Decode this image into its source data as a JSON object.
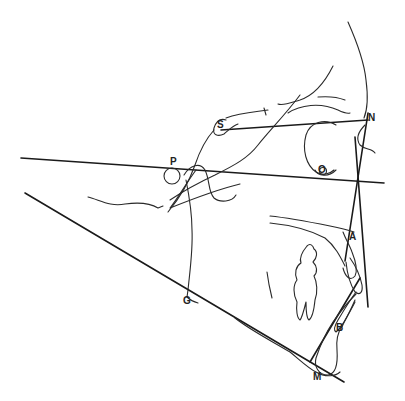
{
  "diagram": {
    "type": "cephalometric tracing",
    "landmarks": [
      {
        "id": "S",
        "label": "S",
        "x": 221,
        "y": 129
      },
      {
        "id": "N",
        "label": "N",
        "x": 372,
        "y": 119
      },
      {
        "id": "P",
        "label": "P",
        "x": 174,
        "y": 162
      },
      {
        "id": "O",
        "label": "O",
        "x": 323,
        "y": 174
      },
      {
        "id": "A",
        "label": "A",
        "x": 353,
        "y": 236
      },
      {
        "id": "B",
        "label": "B",
        "x": 339,
        "y": 327
      },
      {
        "id": "G",
        "label": "G",
        "x": 187,
        "y": 302
      },
      {
        "id": "M",
        "label": "M",
        "x": 318,
        "y": 377
      }
    ],
    "reference_lines": [
      {
        "name": "S-N line",
        "from": "S",
        "to": "N"
      },
      {
        "name": "Frankfort horizontal (P-O)",
        "from": "P",
        "to": "O"
      },
      {
        "name": "N-A line",
        "from": "N",
        "to": "A"
      },
      {
        "name": "A-B line",
        "from": "A",
        "to": "B"
      },
      {
        "name": "Mandibular plane (G-M)",
        "from": "G",
        "to": "M"
      }
    ],
    "colors": {
      "line": "#1a1a1a",
      "background": "#ffffff"
    }
  }
}
